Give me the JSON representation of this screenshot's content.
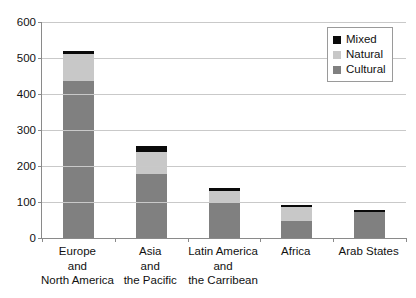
{
  "chart_data": {
    "type": "bar",
    "title": "",
    "xlabel": "",
    "ylabel": "",
    "ylim": [
      0,
      600
    ],
    "ytick_step": 100,
    "yticks": [
      "0",
      "100",
      "200",
      "300",
      "400",
      "500",
      "600"
    ],
    "grid": true,
    "stacked": true,
    "legend_position": "top-right",
    "categories": [
      "Europe\nand\nNorth America",
      "Asia\nand\nthe Pacific",
      "Latin America\nand\nthe Carribean",
      "Africa",
      "Arab States"
    ],
    "category_lines": [
      [
        "Europe",
        "and",
        "North America"
      ],
      [
        "Asia",
        "and",
        "the Pacific"
      ],
      [
        "Latin America",
        "and",
        "the Carribean"
      ],
      [
        "Africa"
      ],
      [
        "Arab States"
      ]
    ],
    "series": [
      {
        "name": "Cultural",
        "color": "#808080",
        "values": [
          435,
          178,
          97,
          47,
          73
        ]
      },
      {
        "name": "Natural",
        "color": "#c8c8c8",
        "values": [
          75,
          62,
          33,
          38,
          0
        ]
      },
      {
        "name": "Mixed",
        "color": "#0a0a0a",
        "values": [
          10,
          17,
          10,
          8,
          5
        ]
      }
    ],
    "totals": [
      520,
      257,
      140,
      93,
      78
    ]
  },
  "legend": {
    "entries": [
      {
        "label": "Mixed",
        "color": "#0a0a0a"
      },
      {
        "label": "Natural",
        "color": "#c8c8c8"
      },
      {
        "label": "Cultural",
        "color": "#808080"
      }
    ]
  },
  "colors": {
    "axis": "#8a8a8a",
    "grid": "#c9c9c9",
    "text": "#111111",
    "background": "#ffffff"
  }
}
